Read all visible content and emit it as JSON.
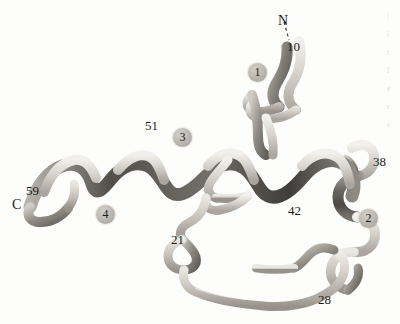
{
  "figure": {
    "kind": "protein-ribbon-diagram",
    "background_color": "#fdfdfc",
    "ink_color": "#1b1b1b",
    "ribbon_light": "#e8e6e1",
    "ribbon_mid": "#a9a59e",
    "ribbon_dark": "#575450"
  },
  "termini": [
    {
      "id": "n-terminus",
      "text": "N",
      "x": 278,
      "y": 14
    },
    {
      "id": "c-terminus",
      "text": "C",
      "x": 12,
      "y": 198
    }
  ],
  "residue_labels": [
    {
      "id": "residue-10",
      "text": "10",
      "x": 287,
      "y": 40
    },
    {
      "id": "residue-21",
      "text": "21",
      "x": 171,
      "y": 233
    },
    {
      "id": "residue-28",
      "text": "28",
      "x": 318,
      "y": 293
    },
    {
      "id": "residue-38",
      "text": "38",
      "x": 373,
      "y": 155
    },
    {
      "id": "residue-42",
      "text": "42",
      "x": 288,
      "y": 204
    },
    {
      "id": "residue-51",
      "text": "51",
      "x": 145,
      "y": 119
    },
    {
      "id": "residue-59",
      "text": "59",
      "x": 26,
      "y": 184
    }
  ],
  "helix_badges": [
    {
      "id": "helix-1",
      "text": "1",
      "x": 248,
      "y": 63
    },
    {
      "id": "helix-2",
      "text": "2",
      "x": 359,
      "y": 209
    },
    {
      "id": "helix-3",
      "text": "3",
      "x": 173,
      "y": 128
    },
    {
      "id": "helix-4",
      "text": "4",
      "x": 96,
      "y": 205
    }
  ],
  "edge_column_fragments": [
    "|",
    "i",
    "t",
    "l",
    "e",
    "r",
    "c"
  ]
}
